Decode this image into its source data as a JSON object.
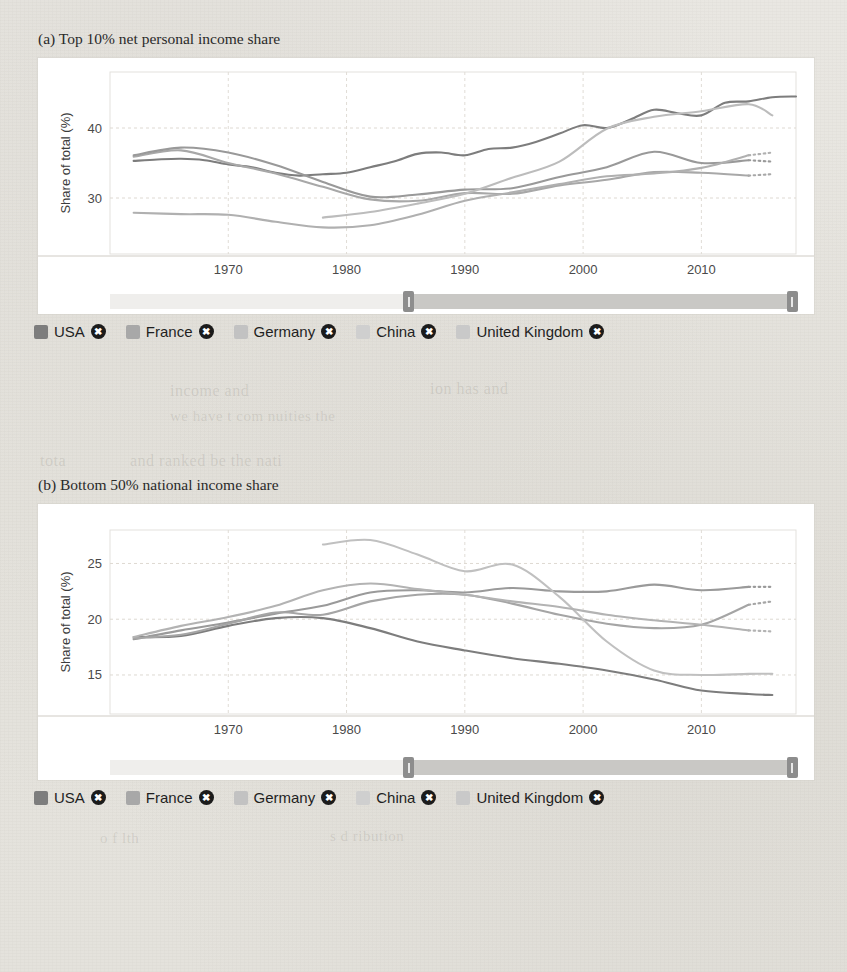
{
  "page": {
    "background_color": "#e7e5e0",
    "card_color": "#ffffff"
  },
  "figures": [
    {
      "caption": "(a) Top 10% net personal income share",
      "slider": {
        "start_fraction": 0.435,
        "end_fraction": 0.995,
        "left_handle_label": "range-start-handle",
        "right_handle_label": "range-end-handle"
      },
      "chart_data": {
        "type": "line",
        "title": "(a) Top 10% net personal income share",
        "xlabel": "",
        "ylabel": "Share of total (%)",
        "xlim": [
          1960,
          2018
        ],
        "ylim": [
          22,
          48
        ],
        "xticks": [
          1970,
          1980,
          1990,
          2000,
          2010
        ],
        "yticks": [
          30,
          40
        ],
        "grid": true,
        "legend_position": "bottom",
        "series": [
          {
            "name": "USA",
            "color": "#7d7d7d",
            "x": [
              1962,
              1964,
              1966,
              1968,
              1970,
              1972,
              1974,
              1976,
              1978,
              1980,
              1982,
              1984,
              1986,
              1988,
              1990,
              1992,
              1994,
              1996,
              1998,
              2000,
              2002,
              2004,
              2006,
              2008,
              2010,
              2012,
              2014,
              2016,
              2018
            ],
            "y": [
              35.3,
              35.5,
              35.6,
              35.4,
              34.8,
              34.4,
              33.6,
              33.2,
              33.4,
              33.6,
              34.4,
              35.2,
              36.3,
              36.5,
              36.1,
              37.0,
              37.2,
              38.0,
              39.2,
              40.4,
              40.0,
              41.2,
              42.6,
              42.1,
              41.8,
              43.6,
              43.8,
              44.4,
              44.5
            ],
            "dashed_tail": false
          },
          {
            "name": "France",
            "color": "#a8a8a8",
            "x": [
              1962,
              1966,
              1970,
              1974,
              1978,
              1982,
              1986,
              1990,
              1994,
              1998,
              2002,
              2006,
              2010,
              2014,
              2016
            ],
            "y": [
              35.9,
              36.8,
              35.0,
              33.5,
              31.6,
              29.8,
              29.6,
              30.7,
              30.6,
              31.8,
              32.6,
              33.7,
              33.6,
              33.2,
              33.4
            ],
            "dashed_tail": true,
            "dashed_from": 2014
          },
          {
            "name": "Germany",
            "color": "#999999",
            "x": [
              1962,
              1966,
              1970,
              1974,
              1978,
              1982,
              1986,
              1990,
              1994,
              1998,
              2002,
              2006,
              2010,
              2014,
              2016
            ],
            "y": [
              36.1,
              37.2,
              36.5,
              34.7,
              32.3,
              30.2,
              30.5,
              31.2,
              31.4,
              33.0,
              34.4,
              36.6,
              35.0,
              35.4,
              35.2
            ],
            "dashed_tail": true,
            "dashed_from": 2014
          },
          {
            "name": "China",
            "color": "#bcbcbc",
            "x": [
              1978,
              1982,
              1986,
              1990,
              1994,
              1998,
              2002,
              2006,
              2010,
              2014,
              2016
            ],
            "y": [
              27.2,
              28.0,
              29.2,
              30.6,
              32.9,
              35.2,
              39.9,
              41.6,
              42.4,
              43.4,
              41.8
            ],
            "dashed_tail": false
          },
          {
            "name": "United Kingdom",
            "color": "#b0b0b0",
            "x": [
              1962,
              1966,
              1970,
              1974,
              1978,
              1982,
              1986,
              1990,
              1994,
              1998,
              2002,
              2006,
              2010,
              2014,
              2016
            ],
            "y": [
              27.9,
              27.7,
              27.6,
              26.6,
              25.8,
              26.1,
              27.6,
              29.6,
              30.8,
              32.0,
              33.1,
              33.5,
              34.3,
              36.1,
              36.5
            ],
            "dashed_tail": true,
            "dashed_from": 2014
          }
        ]
      },
      "legend": [
        {
          "label": "USA",
          "color": "#7d7d7d",
          "close": "✖"
        },
        {
          "label": "France",
          "color": "#a8a8a8",
          "close": "✖"
        },
        {
          "label": "Germany",
          "color": "#c2c2c2",
          "close": "✖"
        },
        {
          "label": "China",
          "color": "#cfcfcf",
          "close": "✖"
        },
        {
          "label": "United Kingdom",
          "color": "#c9c9c9",
          "close": "✖"
        }
      ]
    },
    {
      "caption": "(b) Bottom 50% national income share",
      "slider": {
        "start_fraction": 0.435,
        "end_fraction": 0.995,
        "left_handle_label": "range-start-handle",
        "right_handle_label": "range-end-handle"
      },
      "chart_data": {
        "type": "line",
        "title": "(b) Bottom 50% national income share",
        "xlabel": "",
        "ylabel": "Share of total (%)",
        "xlim": [
          1960,
          2018
        ],
        "ylim": [
          11.5,
          28
        ],
        "xticks": [
          1970,
          1980,
          1990,
          2000,
          2010
        ],
        "yticks": [
          15,
          20,
          25
        ],
        "grid": true,
        "legend_position": "bottom",
        "series": [
          {
            "name": "USA",
            "color": "#7d7d7d",
            "x": [
              1962,
              1966,
              1970,
              1974,
              1978,
              1982,
              1986,
              1990,
              1994,
              1998,
              2002,
              2006,
              2010,
              2014,
              2016
            ],
            "y": [
              18.4,
              18.5,
              19.4,
              20.1,
              20.1,
              19.2,
              18.0,
              17.2,
              16.5,
              16.0,
              15.4,
              14.6,
              13.6,
              13.3,
              13.2
            ],
            "dashed_tail": false
          },
          {
            "name": "France",
            "color": "#9a9a9a",
            "x": [
              1962,
              1966,
              1970,
              1974,
              1978,
              1982,
              1986,
              1990,
              1994,
              1998,
              2002,
              2006,
              2010,
              2014,
              2016
            ],
            "y": [
              18.2,
              19.0,
              19.7,
              20.5,
              21.2,
              22.4,
              22.6,
              22.4,
              22.8,
              22.5,
              22.5,
              23.1,
              22.6,
              22.9,
              22.9
            ],
            "dashed_tail": true,
            "dashed_from": 2014
          },
          {
            "name": "Germany",
            "color": "#a5a5a5",
            "x": [
              1962,
              1966,
              1970,
              1974,
              1978,
              1982,
              1986,
              1990,
              1994,
              1998,
              2002,
              2006,
              2010,
              2014,
              2016
            ],
            "y": [
              18.3,
              18.6,
              19.6,
              20.6,
              20.4,
              21.6,
              22.2,
              22.2,
              21.4,
              20.4,
              19.6,
              19.2,
              19.5,
              21.3,
              21.6
            ],
            "dashed_tail": true,
            "dashed_from": 2014
          },
          {
            "name": "China",
            "color": "#c0c0c0",
            "x": [
              1978,
              1982,
              1986,
              1990,
              1994,
              1998,
              2002,
              2006,
              2010,
              2014,
              2016
            ],
            "y": [
              26.7,
              27.1,
              25.8,
              24.3,
              24.9,
              22.0,
              18.0,
              15.4,
              15.0,
              15.1,
              15.1
            ],
            "dashed_tail": false
          },
          {
            "name": "United Kingdom",
            "color": "#b3b3b3",
            "x": [
              1962,
              1966,
              1970,
              1974,
              1978,
              1982,
              1986,
              1990,
              1994,
              1998,
              2002,
              2006,
              2010,
              2014,
              2016
            ],
            "y": [
              18.4,
              19.4,
              20.2,
              21.2,
              22.6,
              23.2,
              22.7,
              22.2,
              21.6,
              21.1,
              20.4,
              19.9,
              19.5,
              19.0,
              18.9
            ],
            "dashed_tail": true,
            "dashed_from": 2014
          }
        ]
      },
      "legend": [
        {
          "label": "USA",
          "color": "#7d7d7d",
          "close": "✖"
        },
        {
          "label": "France",
          "color": "#a8a8a8",
          "close": "✖"
        },
        {
          "label": "Germany",
          "color": "#c2c2c2",
          "close": "✖"
        },
        {
          "label": "China",
          "color": "#cfcfcf",
          "close": "✖"
        },
        {
          "label": "United Kingdom",
          "color": "#c9c9c9",
          "close": "✖"
        }
      ]
    }
  ],
  "ghost_text": [
    {
      "text": "TABLE 1.1",
      "x": 300,
      "y": 108,
      "size": 17
    },
    {
      "text": "ast c    ate wit assumin  incom",
      "x": 255,
      "y": 110,
      "size": 16
    },
    {
      "text": "mal  th  onsumption",
      "x": 300,
      "y": 140,
      "size": 15
    },
    {
      "text": "the   sho  low",
      "x": 250,
      "y": 210,
      "size": 15
    },
    {
      "text": "opt d  in m",
      "x": 420,
      "y": 232,
      "size": 15
    },
    {
      "text": "income and",
      "x": 170,
      "y": 382,
      "size": 16
    },
    {
      "text": "ion has and",
      "x": 430,
      "y": 380,
      "size": 16
    },
    {
      "text": "we have   t     com    nuities the",
      "x": 170,
      "y": 408,
      "size": 15
    },
    {
      "text": "and  ranked  be    the   nati",
      "x": 130,
      "y": 452,
      "size": 16
    },
    {
      "text": "tota",
      "x": 40,
      "y": 452,
      "size": 16
    },
    {
      "text": "wealth",
      "x": 300,
      "y": 568,
      "size": 16
    },
    {
      "text": "d   6 )",
      "x": 560,
      "y": 566,
      "size": 17
    },
    {
      "text": "( 95 )",
      "x": 575,
      "y": 608,
      "size": 16
    },
    {
      "text": "in  h",
      "x": 600,
      "y": 644,
      "size": 15
    },
    {
      "text": "e d",
      "x": 50,
      "y": 686,
      "size": 15
    },
    {
      "text": "o  f   lth",
      "x": 100,
      "y": 830,
      "size": 15
    },
    {
      "text": "s  d  ribution",
      "x": 330,
      "y": 828,
      "size": 15
    }
  ]
}
